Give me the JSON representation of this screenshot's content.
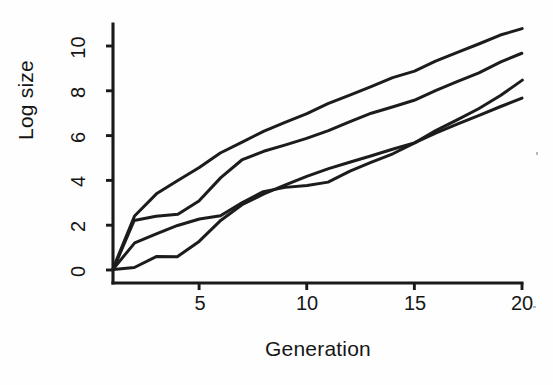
{
  "chart_data": {
    "type": "line",
    "title": "",
    "xlabel": "Generation",
    "ylabel": "Log size",
    "xlim": [
      1,
      20
    ],
    "ylim": [
      0,
      11.2
    ],
    "grid": false,
    "legend": "none",
    "x_ticks": [
      5,
      10,
      15,
      20
    ],
    "y_ticks": [
      0,
      2,
      4,
      6,
      8,
      10
    ],
    "x": [
      1,
      2,
      3,
      4,
      5,
      6,
      7,
      8,
      9,
      10,
      11,
      12,
      13,
      14,
      15,
      16,
      17,
      18,
      19,
      20
    ],
    "series": [
      {
        "name": "line-1",
        "values": [
          0.0,
          2.4,
          3.4,
          4.0,
          4.6,
          5.2,
          5.7,
          6.2,
          6.6,
          7.0,
          7.4,
          7.8,
          8.2,
          8.6,
          8.9,
          9.3,
          9.7,
          10.1,
          10.5,
          10.8
        ]
      },
      {
        "name": "line-2",
        "values": [
          0.0,
          2.2,
          2.4,
          2.5,
          3.1,
          4.1,
          4.9,
          5.3,
          5.6,
          5.9,
          6.2,
          6.6,
          7.0,
          7.3,
          7.6,
          8.0,
          8.4,
          8.8,
          9.3,
          9.7
        ]
      },
      {
        "name": "line-3",
        "values": [
          0.0,
          1.2,
          1.6,
          2.0,
          2.3,
          2.4,
          3.0,
          3.5,
          3.7,
          3.8,
          3.9,
          4.4,
          4.8,
          5.2,
          5.7,
          6.2,
          6.7,
          7.2,
          7.8,
          8.5
        ]
      },
      {
        "name": "line-4",
        "values": [
          0.0,
          0.1,
          0.6,
          0.6,
          1.3,
          2.2,
          2.9,
          3.4,
          3.8,
          4.2,
          4.5,
          4.8,
          5.1,
          5.4,
          5.7,
          6.1,
          6.5,
          6.9,
          7.3,
          7.7
        ]
      }
    ]
  },
  "axes": {
    "y_title": "Log size",
    "x_title": "Generation",
    "y_tick_labels": [
      "0",
      "2",
      "4",
      "6",
      "8",
      "10"
    ],
    "x_tick_labels": [
      "5",
      "10",
      "15",
      "20"
    ]
  },
  "style": {
    "line_color": "#1c1c1c",
    "axis_color": "#1a1a1a",
    "background": "#fefefe",
    "text_color": "#161616"
  }
}
